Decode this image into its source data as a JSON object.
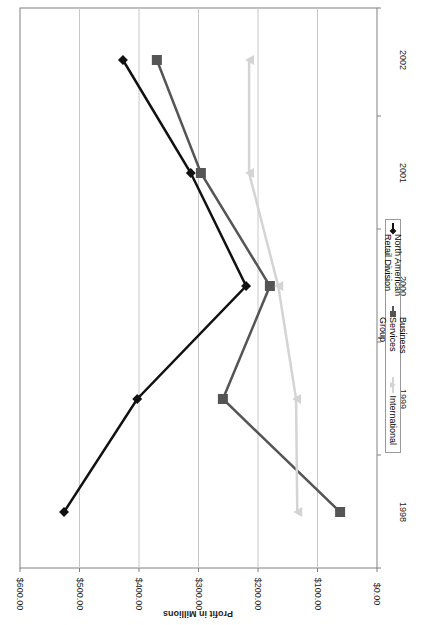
{
  "chart_data": {
    "type": "line",
    "orientation": "rotated 90 degrees (years on right, profit axis along bottom)",
    "title": "",
    "xlabel": "",
    "ylabel": "Profit in Millions",
    "categories": [
      "1998",
      "1999",
      "2000",
      "2001",
      "2002"
    ],
    "ylim": [
      0,
      600
    ],
    "y_ticks": [
      "$0.00",
      "$100.00",
      "$200.00",
      "$300.00",
      "$400.00",
      "$500.00",
      "$600.00"
    ],
    "grid": true,
    "legend_position": "right (bottom of rotated chart)",
    "series": [
      {
        "name": "North American Retail Division",
        "color": "#111111",
        "marker": "diamond",
        "values": [
          526,
          403,
          220,
          313,
          427
        ]
      },
      {
        "name": "Business Services Group",
        "color": "#555555",
        "marker": "square",
        "values": [
          62,
          259,
          180,
          296,
          370
        ]
      },
      {
        "name": "International",
        "color": "#d4d4d4",
        "marker": "triangle",
        "values": [
          134,
          136,
          166,
          215,
          215
        ]
      }
    ]
  },
  "axis": {
    "y_title": "Profit in Millions",
    "y_ticks": [
      "$600.00",
      "$500.00",
      "$400.00",
      "$300.00",
      "$200.00",
      "$100.00",
      "$0.00"
    ],
    "x_ticks": [
      "1998",
      "1999",
      "2000",
      "2001",
      "2002"
    ]
  },
  "legend": {
    "items": [
      {
        "label": "North American Retail Division",
        "color": "#111111"
      },
      {
        "label": "Business Services Group",
        "color": "#555555"
      },
      {
        "label": "International",
        "color": "#d4d4d4"
      }
    ]
  }
}
